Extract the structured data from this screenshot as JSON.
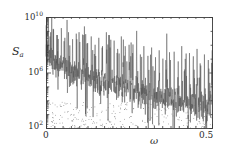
{
  "chart_data": {
    "type": "line",
    "title": "",
    "subtitle": "",
    "xlabel": "ω",
    "ylabel": "S",
    "ylabel_subscript": "a",
    "xlabel_text": "omega",
    "yscale": "log",
    "xscale": "linear",
    "xlim": [
      0,
      0.5
    ],
    "ylim": [
      100,
      10000000000
    ],
    "grid": false,
    "legend": null,
    "xticks": [
      {
        "value": 0,
        "label": "0"
      },
      {
        "value": 0.5,
        "label": "0.5"
      }
    ],
    "xminor_tick_count": 20,
    "yticks": [
      {
        "value": 100,
        "mantissa": "10",
        "exponent": "2",
        "label": "10^2"
      },
      {
        "value": 1000000,
        "mantissa": "10",
        "exponent": "6",
        "label": "10^6"
      },
      {
        "value": 10000000000,
        "mantissa": "10",
        "exponent": "10",
        "label": "10^10"
      }
    ],
    "series": [
      {
        "name": "Sa",
        "description": "Noisy power spectral density with regularly spaced harmonic spikes decaying with frequency over a broadband noise floor",
        "color": "#555555",
        "noise_floor_start_exp": 7.6,
        "noise_floor_end_exp": 3.4,
        "noise_band_exp": 1.5,
        "peak_spacing": 0.0227,
        "peak_top_exp_start": 9.3,
        "peak_top_exp_end": 6.6,
        "sample_count": 900
      }
    ],
    "peaks": [
      {
        "omega": 0.0,
        "value_exp": 9.4
      },
      {
        "omega": 0.014,
        "value_exp": 8.9
      },
      {
        "omega": 0.023,
        "value_exp": 9.1
      },
      {
        "omega": 0.034,
        "value_exp": 8.7
      },
      {
        "omega": 0.046,
        "value_exp": 9.2
      },
      {
        "omega": 0.057,
        "value_exp": 8.5
      },
      {
        "omega": 0.068,
        "value_exp": 8.9
      },
      {
        "omega": 0.08,
        "value_exp": 8.4
      },
      {
        "omega": 0.091,
        "value_exp": 8.8
      },
      {
        "omega": 0.102,
        "value_exp": 8.2
      },
      {
        "omega": 0.114,
        "value_exp": 8.7
      },
      {
        "omega": 0.125,
        "value_exp": 8.1
      },
      {
        "omega": 0.136,
        "value_exp": 8.6
      },
      {
        "omega": 0.148,
        "value_exp": 8.0
      },
      {
        "omega": 0.159,
        "value_exp": 8.5
      },
      {
        "omega": 0.17,
        "value_exp": 7.9
      },
      {
        "omega": 0.182,
        "value_exp": 8.9
      },
      {
        "omega": 0.193,
        "value_exp": 7.8
      },
      {
        "omega": 0.205,
        "value_exp": 8.3
      },
      {
        "omega": 0.216,
        "value_exp": 7.7
      },
      {
        "omega": 0.227,
        "value_exp": 8.6
      },
      {
        "omega": 0.239,
        "value_exp": 7.5
      },
      {
        "omega": 0.25,
        "value_exp": 8.0
      },
      {
        "omega": 0.261,
        "value_exp": 7.4
      },
      {
        "omega": 0.273,
        "value_exp": 9.0
      },
      {
        "omega": 0.284,
        "value_exp": 7.3
      },
      {
        "omega": 0.295,
        "value_exp": 7.9
      },
      {
        "omega": 0.307,
        "value_exp": 7.2
      },
      {
        "omega": 0.318,
        "value_exp": 7.8
      },
      {
        "omega": 0.33,
        "value_exp": 7.1
      },
      {
        "omega": 0.341,
        "value_exp": 7.6
      },
      {
        "omega": 0.352,
        "value_exp": 7.0
      },
      {
        "omega": 0.364,
        "value_exp": 8.8
      },
      {
        "omega": 0.375,
        "value_exp": 6.9
      },
      {
        "omega": 0.386,
        "value_exp": 7.5
      },
      {
        "omega": 0.398,
        "value_exp": 6.8
      },
      {
        "omega": 0.409,
        "value_exp": 7.9
      },
      {
        "omega": 0.42,
        "value_exp": 6.7
      },
      {
        "omega": 0.432,
        "value_exp": 7.4
      },
      {
        "omega": 0.443,
        "value_exp": 6.6
      },
      {
        "omega": 0.455,
        "value_exp": 7.7
      },
      {
        "omega": 0.466,
        "value_exp": 6.5
      },
      {
        "omega": 0.477,
        "value_exp": 7.3
      },
      {
        "omega": 0.489,
        "value_exp": 6.9
      },
      {
        "omega": 0.5,
        "value_exp": 7.6
      }
    ],
    "plot_area": {
      "left": 46,
      "top": 17,
      "width": 166,
      "height": 111
    },
    "frame_color": "#3a3a3a",
    "background": "#ffffff"
  }
}
